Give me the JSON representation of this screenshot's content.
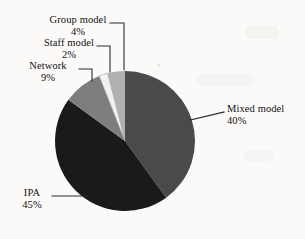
{
  "chart_data": {
    "type": "pie",
    "title": "",
    "categories": [
      "Mixed model",
      "IPA",
      "Network",
      "Staff model",
      "Group model"
    ],
    "values": [
      40,
      45,
      9,
      2,
      4
    ],
    "labels": [
      "40%",
      "45%",
      "9%",
      "2%",
      "4%"
    ],
    "unit": "%",
    "legend": "none",
    "grid": false,
    "colors": [
      "#4a4a4a",
      "#1a1a1a",
      "#7d7d7d",
      "#f2f1ee",
      "#b0b0b0"
    ],
    "start_angle_deg": 0,
    "direction": "clockwise",
    "slices": [
      {
        "name": "Mixed model",
        "value": 40,
        "label": "40%",
        "color": "#4a4a4a"
      },
      {
        "name": "IPA",
        "value": 45,
        "label": "45%",
        "color": "#1a1a1a"
      },
      {
        "name": "Network",
        "value": 9,
        "label": "9%",
        "color": "#7d7d7d"
      },
      {
        "name": "Staff model",
        "value": 2,
        "label": "2%",
        "color": "#f2f1ee"
      },
      {
        "name": "Group model",
        "value": 4,
        "label": "4%",
        "color": "#b0b0b0"
      }
    ]
  },
  "annotations": {
    "group": {
      "name": "Group model",
      "pct": "4%"
    },
    "staff": {
      "name": "Staff model",
      "pct": "2%"
    },
    "network": {
      "name": "Network",
      "pct": "9%"
    },
    "mixed": {
      "name": "Mixed model",
      "pct": "40%"
    },
    "ipa": {
      "name": "IPA",
      "pct": "45%"
    }
  },
  "style": {
    "background": "#fbfaf8",
    "text_color": "#111111",
    "leader_color": "#2a2a2a"
  }
}
